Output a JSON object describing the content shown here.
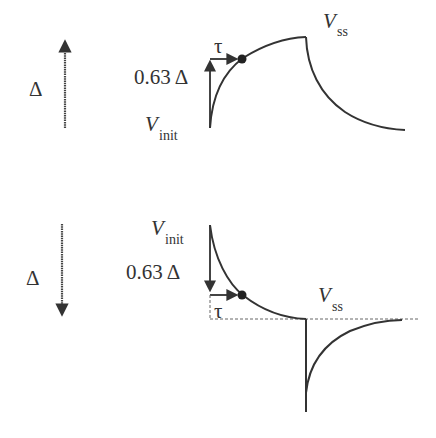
{
  "diagram": {
    "colors": {
      "stroke": "#333333",
      "arrow": "#444444",
      "dashed": "#666666",
      "background": "#ffffff"
    },
    "top_panel": {
      "delta_label": "Δ",
      "delta_arrow_direction": "up",
      "fraction_label": "0.63 Δ",
      "tau_label": "τ",
      "v_init": {
        "symbol": "V",
        "subscript": "init"
      },
      "v_ss": {
        "symbol": "V",
        "subscript": "ss"
      }
    },
    "bottom_panel": {
      "delta_label": "Δ",
      "delta_arrow_direction": "down",
      "fraction_label": "0.63 Δ",
      "tau_label": "τ",
      "v_init": {
        "symbol": "V",
        "subscript": "init"
      },
      "v_ss": {
        "symbol": "V",
        "subscript": "ss"
      }
    }
  }
}
